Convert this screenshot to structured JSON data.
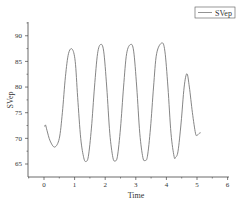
{
  "chart_data": {
    "type": "line",
    "title": "",
    "xlabel": "Time",
    "ylabel": "SVep",
    "xlim": [
      -0.5,
      6
    ],
    "ylim": [
      62.5,
      92.7
    ],
    "xticks": [
      0,
      1,
      2,
      3,
      4,
      5,
      6
    ],
    "yticks": [
      65,
      70,
      75,
      80,
      85,
      90
    ],
    "xtick_labels": [
      "0",
      "1",
      "2",
      "3",
      "4",
      "5",
      "6"
    ],
    "ytick_labels": [
      "65",
      "70",
      "75",
      "80",
      "85",
      "90"
    ],
    "grid": false,
    "legend": {
      "position": "top-right",
      "entries": [
        "SVep"
      ]
    },
    "series": [
      {
        "name": "SVep",
        "color": "#777777",
        "x": [
          0.02,
          0.05,
          0.1,
          0.2,
          0.35,
          0.5,
          0.6,
          0.7,
          0.8,
          0.92,
          1.02,
          1.1,
          1.2,
          1.3,
          1.37,
          1.45,
          1.55,
          1.65,
          1.75,
          1.85,
          1.95,
          2.05,
          2.15,
          2.25,
          2.32,
          2.4,
          2.5,
          2.6,
          2.7,
          2.83,
          2.93,
          3.03,
          3.13,
          3.23,
          3.3,
          3.38,
          3.48,
          3.58,
          3.68,
          3.85,
          3.95,
          4.05,
          4.15,
          4.25,
          4.3,
          4.38,
          4.48,
          4.58,
          4.67,
          4.75,
          4.85,
          4.95,
          5.0,
          5.08,
          5.12
        ],
        "y": [
          72.3,
          72.6,
          71.5,
          69.5,
          68.3,
          70,
          75,
          82,
          86.5,
          87.4,
          85,
          78,
          70,
          66.2,
          65.5,
          66.5,
          72,
          80,
          86.5,
          88.3,
          87,
          80,
          71,
          66.3,
          65.6,
          66.5,
          72,
          80,
          86.5,
          88.3,
          87,
          80,
          71,
          66.3,
          65.7,
          66.5,
          72,
          80,
          86.5,
          88.6,
          87,
          80,
          71,
          66.5,
          66.3,
          67.5,
          73,
          80,
          82.6,
          80,
          75,
          71,
          70.6,
          71,
          71.1
        ]
      }
    ]
  }
}
